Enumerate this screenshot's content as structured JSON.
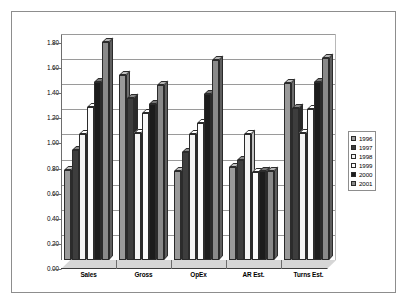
{
  "chart_data": {
    "type": "bar",
    "title": "",
    "subtitle": "",
    "xlabel": "",
    "ylabel": "",
    "ylim": [
      0.0,
      1.8
    ],
    "ytick_step": 0.2,
    "grid": true,
    "legend_position": "right",
    "style": "3d-clustered-column-grayscale",
    "categories": [
      "Sales",
      "Gross",
      "OpEx",
      "AR Est.",
      "Turns Est."
    ],
    "ytick_labels": [
      "0.00",
      "0.20",
      "0.40",
      "0.60",
      "0.80",
      "1.00",
      "1.20",
      "1.40",
      "1.60",
      "1.80"
    ],
    "series": [
      {
        "name": "1996",
        "color": "#9a9a9a",
        "values": [
          0.72,
          1.47,
          0.71,
          0.74,
          1.41
        ]
      },
      {
        "name": "1997",
        "color": "#3d3d3d",
        "values": [
          0.88,
          1.29,
          0.86,
          0.8,
          1.21
        ]
      },
      {
        "name": "1998",
        "color": "#f4f4f4",
        "values": [
          1.0,
          1.01,
          1.0,
          1.0,
          1.01
        ]
      },
      {
        "name": "1999",
        "color": "#fbfbfb",
        "values": [
          1.22,
          1.17,
          1.09,
          0.7,
          1.2
        ]
      },
      {
        "name": "2000",
        "color": "#1c1c1c",
        "values": [
          1.42,
          1.24,
          1.32,
          0.71,
          1.42
        ]
      },
      {
        "name": "2001",
        "color": "#8a8a8a",
        "values": [
          1.74,
          1.39,
          1.59,
          0.71,
          1.61
        ]
      }
    ]
  },
  "legend": {
    "items": [
      {
        "label": "1996"
      },
      {
        "label": "1997"
      },
      {
        "label": "1998"
      },
      {
        "label": "1999"
      },
      {
        "label": "2000"
      },
      {
        "label": "2001"
      }
    ]
  }
}
